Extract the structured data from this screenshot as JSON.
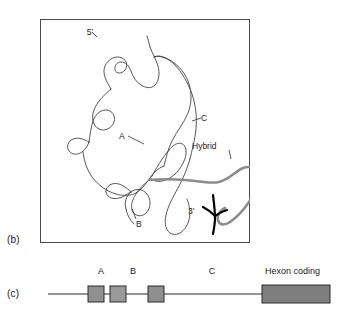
{
  "figure": {
    "panels": [
      {
        "id": "b",
        "label": "(b)",
        "type": "electron-micrograph-tracing",
        "annotations": [
          {
            "id": "five-prime",
            "text": "5′",
            "x": 93,
            "y": 32
          },
          {
            "id": "leader-a",
            "text": "A",
            "x": 122,
            "y": 135
          },
          {
            "id": "leader-b",
            "text": "B",
            "x": 136,
            "y": 204
          },
          {
            "id": "leader-c",
            "text": "C",
            "x": 201,
            "y": 118
          },
          {
            "id": "hybrid",
            "text": "Hybrid",
            "x": 192,
            "y": 149
          },
          {
            "id": "three-prime",
            "text": "3′",
            "x": 187,
            "y": 211
          }
        ]
      },
      {
        "id": "c",
        "label": "(c)",
        "type": "gene-map",
        "segments": [
          {
            "id": "exon-a1",
            "label": "",
            "x": 88,
            "width": 16
          },
          {
            "id": "exon-a2",
            "label": "",
            "x": 110,
            "width": 16
          },
          {
            "id": "exon-b",
            "label": "",
            "x": 148,
            "width": 16
          },
          {
            "id": "hexon",
            "label": "",
            "x": 262,
            "width": 68
          }
        ],
        "labels": [
          {
            "id": "map-label-a",
            "text": "A",
            "x": 101,
            "y": 19
          },
          {
            "id": "map-label-b",
            "text": "B",
            "x": 133,
            "y": 19
          },
          {
            "id": "map-label-c",
            "text": "C",
            "x": 212,
            "y": 19
          },
          {
            "id": "map-label-hexon",
            "text": "Hexon coding",
            "x": 265,
            "y": 19
          }
        ]
      }
    ]
  },
  "colors": {
    "dna_strand": "#3a3a3a",
    "hybrid_strand": "#8c8c8c",
    "exon_fill": "#8f8f8f",
    "hexon_fill": "#7e7e7e",
    "frame_border": "#4b4b4b",
    "text": "#1a1a1a",
    "background": "#ffffff"
  }
}
